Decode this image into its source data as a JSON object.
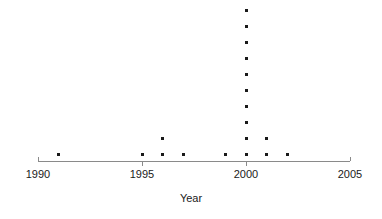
{
  "chart_data": {
    "type": "scatter",
    "plot_style": "stacked-dot-plot",
    "title": "",
    "subtitle": "",
    "xlabel": "Year",
    "ylabel": "",
    "xlim": [
      1990,
      2005
    ],
    "ylim": [
      0,
      10
    ],
    "grid": false,
    "legend": null,
    "x_ticks": [
      1990,
      1995,
      2000,
      2005
    ],
    "x_tick_labels": [
      "1990",
      "1995",
      "2000",
      "2005"
    ],
    "y_axis_visible": false,
    "categories": [
      1991,
      1995,
      1996,
      1997,
      1999,
      2000,
      2001,
      2002
    ],
    "values": [
      1,
      1,
      2,
      1,
      1,
      10,
      2,
      1
    ],
    "points": [
      {
        "x": 1991,
        "count": 1
      },
      {
        "x": 1995,
        "count": 1
      },
      {
        "x": 1996,
        "count": 2
      },
      {
        "x": 1997,
        "count": 1
      },
      {
        "x": 1999,
        "count": 1
      },
      {
        "x": 2000,
        "count": 10
      },
      {
        "x": 2001,
        "count": 2
      },
      {
        "x": 2002,
        "count": 1
      }
    ],
    "total_points": 19,
    "colors": {
      "marker": "#1a1a1a",
      "axis": "#8a8a8a",
      "text": "#1a1a1a",
      "background": "#ffffff"
    },
    "annotations": []
  },
  "axis": {
    "title": "Year",
    "tick_labels": [
      "1990",
      "1995",
      "2000",
      "2005"
    ]
  }
}
